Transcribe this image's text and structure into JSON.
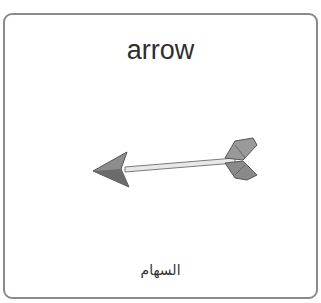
{
  "card": {
    "title": "arrow",
    "subtitle": "السهام",
    "image": {
      "icon": "arrow-icon",
      "description": "arrow pointing left with gray fletching"
    },
    "border_color": "#8a8a8a"
  }
}
